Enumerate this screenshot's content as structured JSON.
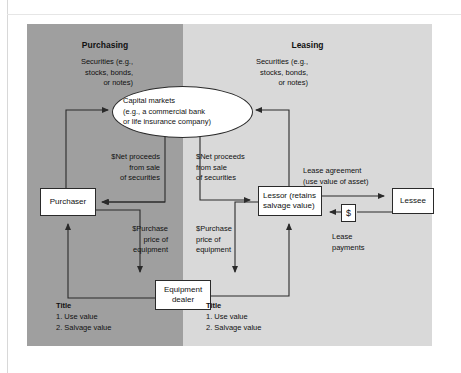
{
  "figure": {
    "panels": {
      "left_header": "Purchasing",
      "right_header": "Leasing",
      "left_color": "#9f9f9f",
      "right_color": "#d9d9d9"
    },
    "center_node": {
      "line1": "Capital markets",
      "line2": "(e.g., a commercial bank",
      "line3": "or life insurance company)"
    },
    "nodes": {
      "purchaser": "Purchaser",
      "equipment_dealer_l1": "Equipment",
      "equipment_dealer_l2": "dealer",
      "lessor_l1": "Lessor (retains",
      "lessor_l2": "salvage value)",
      "lessee": "Lessee",
      "dollar": "$"
    },
    "labels": {
      "securities_left_l1": "Securities (e.g.,",
      "securities_left_l2": "stocks, bonds,",
      "securities_left_l3": "or notes)",
      "securities_right_l1": "Securities (e.g.,",
      "securities_right_l2": "stocks, bonds,",
      "securities_right_l3": "or notes)",
      "net_left_l1": "$Net proceeds",
      "net_left_l2": "from sale",
      "net_left_l3": "of securities",
      "net_right_l1": "$Net proceeds",
      "net_right_l2": "from sale",
      "net_right_l3": "of securities",
      "purchase_left_l1": "$Purchase",
      "purchase_left_l2": "price of",
      "purchase_left_l3": "equipment",
      "purchase_right_l1": "$Purchase",
      "purchase_right_l2": "price of",
      "purchase_right_l3": "equipment",
      "lease_agreement_l1": "Lease agreement",
      "lease_agreement_l2": "(use value of asset)",
      "lease_payments_l1": "Lease",
      "lease_payments_l2": "payments"
    },
    "title_left": {
      "heading": "Title",
      "item1": "1. Use value",
      "item2": "2. Salvage value"
    },
    "title_right": {
      "heading": "Title",
      "item1": "1. Use value",
      "item2": "2. Salvage value"
    }
  }
}
